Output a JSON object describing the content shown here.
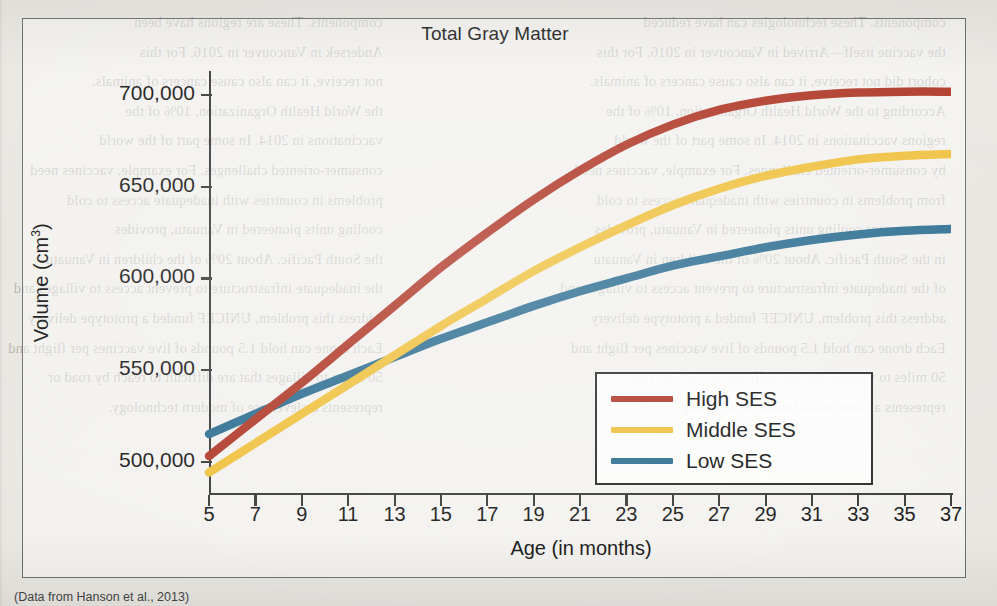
{
  "chart_data": {
    "type": "line",
    "title": "Total Gray Matter",
    "xlabel": "Age (in months)",
    "ylabel": "Volume (cm3)",
    "ylabel_base": "Volume (cm",
    "ylabel_sup": "3",
    "ylabel_close": ")",
    "xlim": [
      5,
      37
    ],
    "ylim": [
      485000,
      710000
    ],
    "grid": false,
    "legend_position": "lower-right",
    "x_tick_labels": [
      "5",
      "7",
      "9",
      "11",
      "13",
      "15",
      "17",
      "19",
      "21",
      "23",
      "25",
      "27",
      "29",
      "31",
      "33",
      "35",
      "37"
    ],
    "x_ticks": [
      5,
      7,
      9,
      11,
      13,
      15,
      17,
      19,
      21,
      23,
      25,
      27,
      29,
      31,
      33,
      35,
      37
    ],
    "y_tick_labels": [
      "500,000",
      "550,000",
      "600,000",
      "650,000",
      "700,000"
    ],
    "y_ticks": [
      500000,
      550000,
      600000,
      650000,
      700000
    ],
    "x": [
      5,
      7,
      9,
      11,
      13,
      15,
      17,
      19,
      21,
      23,
      25,
      27,
      29,
      31,
      33,
      35,
      37
    ],
    "series": [
      {
        "name": "High SES",
        "color": "#b03a2a",
        "values": [
          503000,
          523000,
          543000,
          564000,
          585000,
          606000,
          625000,
          643000,
          659000,
          673000,
          684000,
          692000,
          697000,
          700000,
          701500,
          702000,
          702000
        ]
      },
      {
        "name": "Middle SES",
        "color": "#efc13f",
        "values": [
          494000,
          510000,
          526000,
          542000,
          558000,
          574000,
          589000,
          604000,
          617000,
          629000,
          640000,
          649000,
          656000,
          661000,
          665000,
          667000,
          668000
        ]
      },
      {
        "name": "Low SES",
        "color": "#2e6f92",
        "values": [
          515000,
          526000,
          537000,
          547000,
          557000,
          567000,
          576000,
          585000,
          593000,
          600000,
          607000,
          612000,
          617000,
          621000,
          624000,
          626000,
          627000
        ]
      }
    ]
  },
  "legend": {
    "items": [
      {
        "label": "High SES",
        "color": "#b03a2a"
      },
      {
        "label": "Middle SES",
        "color": "#efc13f"
      },
      {
        "label": "Low SES",
        "color": "#2e6f92"
      }
    ]
  },
  "caption": {
    "fragment": "(Data from Hanson et al., 2013)"
  },
  "page_bleed": {
    "left_column": [
      "components.  These are regions have been",
      "Andersek in Vancouver in 2016.  For this",
      "not receive, it can also cause cancers of animals.",
      "the World Health Organization, 10% of the",
      "vaccinations in 2014.  In some part of the world",
      "consumer-oriented challenges.  For example, vaccines need",
      "problems in countries with inadequate access to cold",
      "cooling units pioneered in Vanuatu, provides",
      "the South Pacific.  About 20% of the children in Vanuatu",
      "the inadequate infrastructure to prevent access to villages and",
      "address this problem, UNICEF funded a prototype delivery",
      "Each drone can hold 1.5 pounds of live vaccines per flight and",
      "50 miles to villages that are difficult to reach by road or",
      "represents a clever use of modern technology."
    ],
    "right_column": [
      "components.  These technologies can have reduced",
      "the vaccine itself—Arrived in Vancouver in 2016.  For this",
      "cohort did not receive, it can also cause cancers of animals.",
      "According to the World Health Organization, 10% of the",
      "regions vaccinations in 2014.  In some part of the world",
      "by consumer-oriented challenges.  For example, vaccines need",
      "from problems in countries with inadequate access to cold",
      "measurement cooling units pioneered in Vanuatu, provides",
      "in the South Pacific.  About 20% of the children in Vanuatu",
      "of the inadequate infrastructure to prevent access to villages and",
      "address this problem, UNICEF funded a prototype delivery",
      "Each drone can hold 1.5 pounds of live vaccines per flight and",
      "50 miles to villages that are difficult to reach by road or",
      "represents a clever use of modern technology."
    ]
  }
}
